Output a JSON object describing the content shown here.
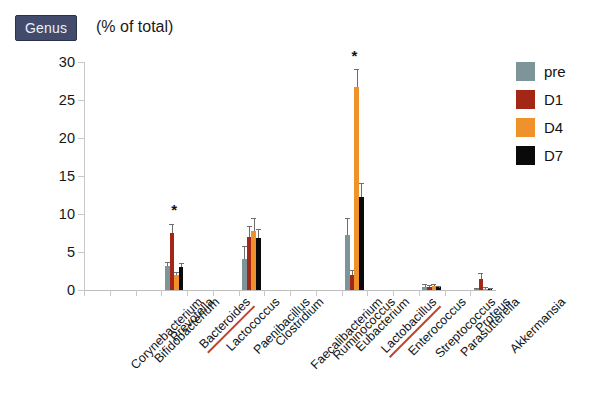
{
  "header": {
    "badge_label": "Genus",
    "title": "(% of total)"
  },
  "legend": {
    "position": "right",
    "items": [
      {
        "label": "pre",
        "color": "#7d9499"
      },
      {
        "label": "D1",
        "color": "#a32617"
      },
      {
        "label": "D4",
        "color": "#f0922b"
      },
      {
        "label": "D7",
        "color": "#0a0a0a"
      }
    ]
  },
  "annotations": {
    "significance_marker": "*",
    "underline_color": "#c0452a",
    "underlined_categories": [
      "Bacteroides",
      "Lactobacillus"
    ]
  },
  "chart_data": {
    "type": "bar",
    "title": "(% of total)",
    "xlabel": "",
    "ylabel": "",
    "ylim": [
      0,
      30
    ],
    "yticks": [
      0,
      5,
      10,
      15,
      20,
      25,
      30
    ],
    "ytick_labels": [
      "0",
      "5",
      "10",
      "15",
      "20",
      "25",
      "30"
    ],
    "grid": false,
    "legend_position": "right",
    "categories": [
      "Corynebacterium",
      "Bifidobacterium",
      "Prevotella",
      "Bacteroides",
      "Lactococcus",
      "Paenibacillus",
      "Clostridium",
      "Faecalibacterium",
      "Ruminococcus",
      "Eubacterium",
      "Lactobacillus",
      "Enterococcus",
      "Streptococcus",
      "Parasutterella",
      "Proteus",
      "Akkermansia"
    ],
    "series": [
      {
        "name": "pre",
        "color": "#7d9499",
        "values": [
          0,
          0,
          0,
          3.1,
          0,
          0,
          4.1,
          0,
          0,
          0,
          7.3,
          0,
          0,
          0.45,
          0,
          0.1
        ],
        "errors": [
          0,
          0,
          0,
          0.5,
          0,
          0,
          1.6,
          0,
          0,
          0,
          2.0,
          0,
          0,
          0.15,
          0,
          0.05
        ]
      },
      {
        "name": "D1",
        "color": "#a32617",
        "values": [
          0,
          0,
          0,
          7.5,
          0,
          0,
          7.0,
          0,
          0,
          0,
          2.0,
          0,
          0,
          0.4,
          0,
          1.5
        ],
        "errors": [
          0,
          0,
          0,
          1.1,
          0,
          0,
          1.3,
          0,
          0,
          0,
          0.5,
          0,
          0,
          0.12,
          0,
          0.6
        ]
      },
      {
        "name": "D4",
        "color": "#f0922b",
        "values": [
          0,
          0,
          0,
          2.0,
          0,
          0,
          7.8,
          0,
          0,
          0,
          26.7,
          0,
          0,
          0.5,
          0,
          0.15
        ],
        "errors": [
          0,
          0,
          0,
          0.3,
          0,
          0,
          1.6,
          0,
          0,
          0,
          2.3,
          0,
          0,
          0.15,
          0,
          0.07
        ]
      },
      {
        "name": "D7",
        "color": "#0a0a0a",
        "values": [
          0,
          0,
          0,
          3.0,
          0,
          0,
          6.9,
          0,
          0,
          0,
          12.2,
          0,
          0,
          0.35,
          0,
          0.1
        ],
        "errors": [
          0,
          0,
          0,
          0.4,
          0,
          0,
          1.0,
          0,
          0,
          0,
          1.8,
          0,
          0,
          0.1,
          0,
          0.05
        ]
      }
    ],
    "significance": [
      {
        "category": "Bacteroides",
        "marker": "*",
        "y": 9.8
      },
      {
        "category": "Lactobacillus",
        "marker": "*",
        "y": 30.0
      }
    ]
  }
}
